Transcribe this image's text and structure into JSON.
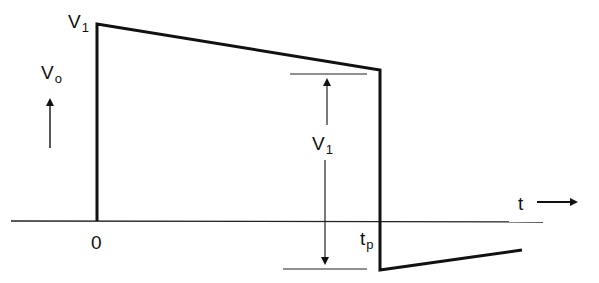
{
  "diagram": {
    "labels": {
      "peak_label_main": "V",
      "peak_label_sub": "1",
      "y_axis_main": "V",
      "y_axis_sub": "o",
      "amplitude_main": "V",
      "amplitude_sub": "1",
      "time_axis": "t",
      "origin": "0",
      "pulse_end_main": "t",
      "pulse_end_sub": "p"
    },
    "waveform_points": [
      [
        97,
        221
      ],
      [
        97,
        24
      ],
      [
        380,
        70
      ],
      [
        380,
        270
      ],
      [
        522,
        250
      ]
    ],
    "time_axis_line": {
      "x1": 11,
      "x2": 543,
      "y": 221
    },
    "colors": {
      "line": "#111111",
      "background": "#ffffff"
    }
  }
}
